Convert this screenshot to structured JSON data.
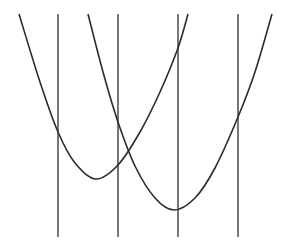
{
  "figure": {
    "width": 286,
    "height": 251,
    "background": "#ffffff",
    "stroke_color": "#2b2b2b",
    "vertical_line_color": "#555555",
    "vertical_lines": [
      {
        "x": 58,
        "y1": 14,
        "y2": 237
      },
      {
        "x": 118,
        "y1": 14,
        "y2": 237
      },
      {
        "x": 178,
        "y1": 14,
        "y2": 237
      },
      {
        "x": 238,
        "y1": 14,
        "y2": 237
      }
    ],
    "curves": [
      {
        "name": "parabola-left",
        "vertex": [
          96,
          179
        ],
        "points": [
          [
            19,
            14
          ],
          [
            40,
            82
          ],
          [
            58,
            132
          ],
          [
            75,
            163
          ],
          [
            96,
            179
          ],
          [
            118,
            165
          ],
          [
            140,
            132
          ],
          [
            160,
            92
          ],
          [
            178,
            48
          ],
          [
            188,
            14
          ]
        ]
      },
      {
        "name": "parabola-right",
        "vertex": [
          174,
          210
        ],
        "points": [
          [
            88,
            14
          ],
          [
            103,
            72
          ],
          [
            118,
            122
          ],
          [
            135,
            166
          ],
          [
            155,
            198
          ],
          [
            174,
            210
          ],
          [
            195,
            198
          ],
          [
            215,
            168
          ],
          [
            238,
            117
          ],
          [
            255,
            72
          ],
          [
            272,
            14
          ]
        ]
      }
    ]
  }
}
